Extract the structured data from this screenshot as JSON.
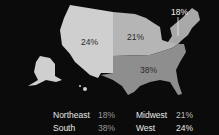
{
  "map": {
    "regions": [
      {
        "name": "West",
        "value": "24%",
        "color": "#cfcfcf"
      },
      {
        "name": "Midwest",
        "value": "21%",
        "color": "#b5b5b5"
      },
      {
        "name": "Northeast",
        "value": "18%",
        "color": "#a8a8a8"
      },
      {
        "name": "South",
        "value": "38%",
        "color": "#8e8e8e"
      }
    ]
  },
  "legend": {
    "items": [
      {
        "name": "Northeast",
        "value": "18%"
      },
      {
        "name": "Midwest",
        "value": "21%"
      },
      {
        "name": "South",
        "value": "38%"
      },
      {
        "name": "West",
        "value": "24%"
      }
    ]
  }
}
